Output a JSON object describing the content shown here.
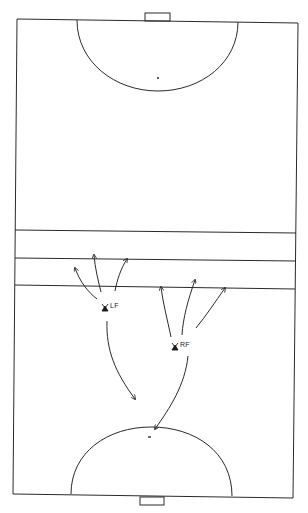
{
  "diagram": {
    "type": "field-hockey-pitch-drill",
    "colors": {
      "line": "#2a2a2a",
      "background": "#ffffff"
    },
    "players": [
      {
        "id": "lf",
        "label": "LF"
      },
      {
        "id": "rf",
        "label": "RF"
      }
    ]
  }
}
